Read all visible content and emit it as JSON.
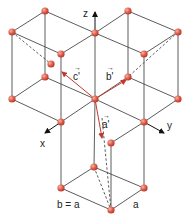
{
  "diagram": {
    "type": "crystal-lattice",
    "labels": {
      "z_axis": "z",
      "x_axis": "x",
      "y_axis": "y",
      "vec_a": "a'",
      "vec_b": "b'",
      "vec_c": "c'",
      "edge_left": "b = a",
      "edge_right": "a"
    },
    "colors": {
      "atom": "#e0604e",
      "atom_highlight": "#f4a090",
      "edge": "#4a4a4a",
      "vector": "#c0392b",
      "axis": "#111111"
    },
    "atoms": [
      [
        45,
        11
      ],
      [
        128,
        11
      ],
      [
        12,
        32
      ],
      [
        95,
        33
      ],
      [
        178,
        32
      ],
      [
        61,
        54
      ],
      [
        144,
        54
      ],
      [
        51,
        64
      ],
      [
        45,
        77
      ],
      [
        128,
        77
      ],
      [
        12,
        99
      ],
      [
        95,
        99
      ],
      [
        178,
        99
      ],
      [
        61,
        122
      ],
      [
        144,
        122
      ],
      [
        111,
        143
      ],
      [
        94,
        167
      ],
      [
        61,
        188
      ],
      [
        144,
        188
      ],
      [
        111,
        210
      ]
    ]
  }
}
